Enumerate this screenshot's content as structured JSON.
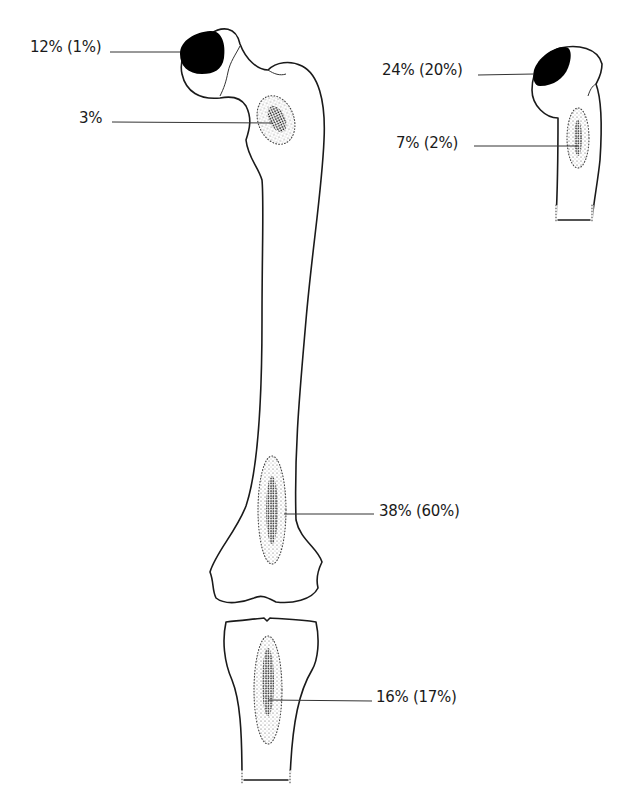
{
  "figure": {
    "type": "anatomical diagram",
    "colors": {
      "line": "#1a1a1a",
      "head_fill": "#000000",
      "background": "#ffffff"
    }
  },
  "labels": {
    "femoral_head": "12% (1%)",
    "femoral_neck_trochanter": "3%",
    "humeral_head": "24% (20%)",
    "proximal_humerus": "7% (2%)",
    "distal_femur": "38% (60%)",
    "proximal_tibia": "16% (17%)"
  }
}
